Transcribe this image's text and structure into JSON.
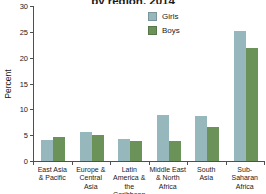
{
  "title_clipped": "by region, 2014",
  "ylabel": "Percent",
  "legend": [
    {
      "label": "Girls",
      "color": "#96b8bc"
    },
    {
      "label": "Boys",
      "color": "#6b9258"
    }
  ],
  "chart_data": {
    "type": "bar",
    "title_partial_visible": "by region, 2014",
    "categories": [
      "East Asia\n& Pacific",
      "Europe &\nCentral\nAsia",
      "Latin\nAmerica &\nthe Caribbean",
      "Middle East\n& North\nAfrica",
      "South\nAsia",
      "Sub-Saharan\nAfrica"
    ],
    "series": [
      {
        "name": "Girls",
        "color": "#96b8bc",
        "values": [
          4.1,
          5.6,
          4.3,
          9.0,
          8.8,
          25.2
        ]
      },
      {
        "name": "Boys",
        "color": "#6b9258",
        "values": [
          4.6,
          5.1,
          3.9,
          3.8,
          6.5,
          21.9
        ]
      }
    ],
    "xlabel": "",
    "ylabel": "Percent",
    "ylim": [
      0,
      30
    ],
    "yticks": [
      0,
      5,
      10,
      15,
      20,
      25,
      30
    ],
    "grid": false,
    "legend_position": "top-right-inside"
  }
}
